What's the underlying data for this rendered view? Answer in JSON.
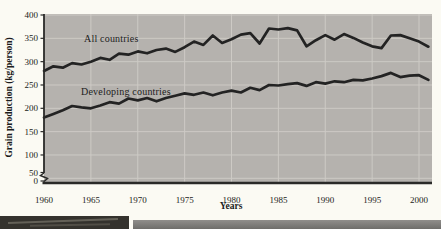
{
  "chart_data": {
    "type": "line",
    "title": "",
    "xlabel": "Years",
    "ylabel": "Grain production (kg/person)",
    "x_ticks": [
      1960,
      1965,
      1970,
      1975,
      1980,
      1985,
      1990,
      1995,
      2000
    ],
    "y_ticks": [
      0,
      50,
      100,
      150,
      200,
      250,
      300,
      350,
      400
    ],
    "xlim": [
      1960,
      2001
    ],
    "ylim": [
      0,
      400
    ],
    "y_axis_break": "between 0 and 50",
    "grid": true,
    "legend_position": "inline-labels",
    "plot_bg_color": "#b5b2ae",
    "gridline_color": "#cdcac5",
    "line_color": "#232323",
    "axis_color": "#2a2a28",
    "x": [
      1960,
      1961,
      1962,
      1963,
      1964,
      1965,
      1966,
      1967,
      1968,
      1969,
      1970,
      1971,
      1972,
      1973,
      1974,
      1975,
      1976,
      1977,
      1978,
      1979,
      1980,
      1981,
      1982,
      1983,
      1984,
      1985,
      1986,
      1987,
      1988,
      1989,
      1990,
      1991,
      1992,
      1993,
      1994,
      1995,
      1996,
      1997,
      1998,
      1999,
      2000,
      2001
    ],
    "series": [
      {
        "name": "All countries",
        "values": [
          280,
          290,
          287,
          297,
          294,
          300,
          308,
          304,
          317,
          315,
          322,
          318,
          325,
          328,
          321,
          331,
          343,
          336,
          356,
          340,
          348,
          358,
          361,
          339,
          371,
          369,
          372,
          367,
          333,
          346,
          357,
          347,
          359,
          351,
          341,
          333,
          329,
          356,
          357,
          350,
          343,
          332
        ]
      },
      {
        "name": "Developing countries",
        "values": [
          180,
          188,
          196,
          205,
          202,
          200,
          206,
          213,
          210,
          221,
          217,
          222,
          215,
          222,
          227,
          232,
          229,
          234,
          228,
          234,
          238,
          234,
          244,
          239,
          250,
          249,
          252,
          254,
          248,
          256,
          253,
          258,
          256,
          261,
          260,
          264,
          269,
          276,
          267,
          270,
          271,
          261
        ]
      }
    ]
  }
}
